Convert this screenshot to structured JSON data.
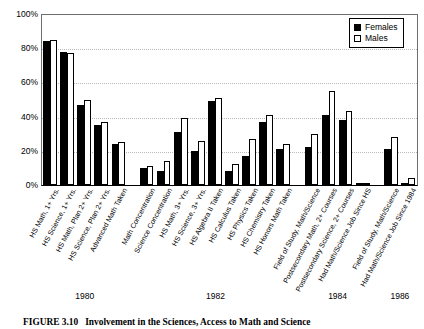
{
  "figure": {
    "caption_number": "FIGURE 3.10",
    "caption_text": "Involvement in the Sciences, Access to Math and Science"
  },
  "legend": {
    "position": "top-right",
    "entries": [
      {
        "label": "Females",
        "swatch": "filled-black-square-icon",
        "color": "#000000"
      },
      {
        "label": "Males",
        "swatch": "open-white-square-icon",
        "color": "#ffffff"
      }
    ]
  },
  "axis": {
    "y_ticks": [
      "0%",
      "20%",
      "40%",
      "60%",
      "80%",
      "100%"
    ],
    "x_group_labels": [
      "1980",
      "1982",
      "1984",
      "1986"
    ]
  },
  "chart_data": {
    "type": "bar",
    "title": "Involvement in the Sciences, Access to Math and Science",
    "xlabel": "",
    "ylabel": "",
    "ylim": [
      0,
      100
    ],
    "yticks": [
      0,
      20,
      40,
      60,
      80,
      100
    ],
    "ytick_labels": [
      "0%",
      "20%",
      "40%",
      "60%",
      "80%",
      "100%"
    ],
    "grid": true,
    "grid_axis": "y",
    "legend_position": "upper right",
    "categories": [
      "HS Math, 1+ Yrs.",
      "HS Science, 1+ Yrs.",
      "HS Math, Plan 2+ Yrs.",
      "HS Science, Plan 2+ Yrs.",
      "Advanced Math Taken",
      "Math Concentration",
      "Science Concentration",
      "HS Math, 3+ Yrs.",
      "HS Science, 3+ Yrs.",
      "HS Algebra II Taken",
      "HS Calculus Taken",
      "HS Physics Taken",
      "HS Chemistry Taken",
      "HS Honors Math Taken",
      "Field of Study, Math/Science",
      "Postsecondary Math, 2+ Courses",
      "Postsecondary Science, 2+ Courses",
      "Had Math/Science Job Since HS",
      "Field of Study, Math/Science",
      "Had Math/Science Job Since 1984"
    ],
    "group_labels": [
      "1980",
      "1982",
      "1984",
      "1986"
    ],
    "group_sizes": [
      5,
      9,
      4,
      2
    ],
    "series": [
      {
        "name": "Females",
        "color": "#000000",
        "values": [
          84,
          78,
          47,
          35,
          24,
          10,
          8,
          31,
          20,
          49,
          8,
          17,
          37,
          21,
          22,
          41,
          38,
          0,
          21,
          1
        ]
      },
      {
        "name": "Males",
        "color": "#ffffff",
        "values": [
          85,
          77,
          50,
          37,
          25,
          11,
          14,
          39,
          26,
          51,
          12,
          27,
          41,
          24,
          30,
          55,
          43,
          1,
          28,
          4
        ]
      }
    ]
  }
}
